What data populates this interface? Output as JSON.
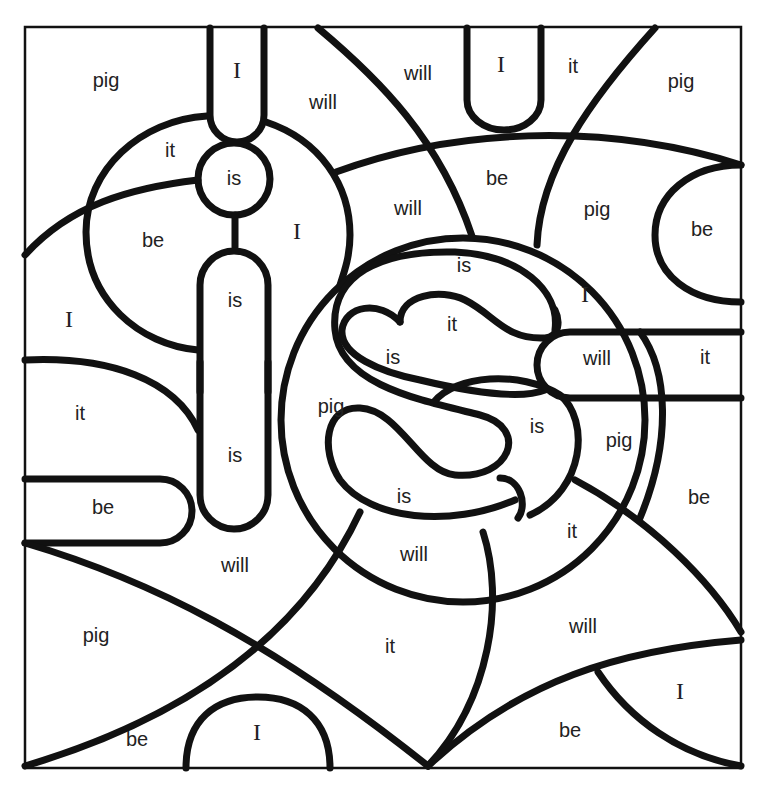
{
  "worksheet": {
    "type": "color-by-sight-word",
    "words": [
      "I",
      "is",
      "it",
      "be",
      "will",
      "pig"
    ],
    "colors": {
      "line": "#111111",
      "background": "#ffffff",
      "text": "#222222"
    }
  },
  "labels": [
    {
      "text": "pig",
      "x": 106,
      "y": 82
    },
    {
      "text": "I",
      "x": 237,
      "y": 72
    },
    {
      "text": "will",
      "x": 323,
      "y": 104
    },
    {
      "text": "will",
      "x": 418,
      "y": 75
    },
    {
      "text": "I",
      "x": 501,
      "y": 66
    },
    {
      "text": "it",
      "x": 573,
      "y": 68
    },
    {
      "text": "pig",
      "x": 681,
      "y": 83
    },
    {
      "text": "it",
      "x": 170,
      "y": 152
    },
    {
      "text": "is",
      "x": 234,
      "y": 180
    },
    {
      "text": "be",
      "x": 497,
      "y": 180
    },
    {
      "text": "will",
      "x": 408,
      "y": 210
    },
    {
      "text": "pig",
      "x": 597,
      "y": 211
    },
    {
      "text": "be",
      "x": 702,
      "y": 231
    },
    {
      "text": "be",
      "x": 153,
      "y": 242
    },
    {
      "text": "I",
      "x": 297,
      "y": 233
    },
    {
      "text": "is",
      "x": 464,
      "y": 267
    },
    {
      "text": "is",
      "x": 235,
      "y": 302
    },
    {
      "text": "I",
      "x": 585,
      "y": 296
    },
    {
      "text": "I",
      "x": 69,
      "y": 321
    },
    {
      "text": "it",
      "x": 452,
      "y": 326
    },
    {
      "text": "is",
      "x": 393,
      "y": 359
    },
    {
      "text": "will",
      "x": 597,
      "y": 360
    },
    {
      "text": "it",
      "x": 705,
      "y": 359
    },
    {
      "text": "pig",
      "x": 331,
      "y": 408
    },
    {
      "text": "it",
      "x": 80,
      "y": 415
    },
    {
      "text": "is",
      "x": 537,
      "y": 428
    },
    {
      "text": "pig",
      "x": 619,
      "y": 442
    },
    {
      "text": "is",
      "x": 235,
      "y": 457
    },
    {
      "text": "is",
      "x": 404,
      "y": 498
    },
    {
      "text": "be",
      "x": 699,
      "y": 499
    },
    {
      "text": "be",
      "x": 103,
      "y": 509
    },
    {
      "text": "it",
      "x": 572,
      "y": 533
    },
    {
      "text": "will",
      "x": 414,
      "y": 556
    },
    {
      "text": "will",
      "x": 235,
      "y": 567
    },
    {
      "text": "will",
      "x": 583,
      "y": 628
    },
    {
      "text": "pig",
      "x": 96,
      "y": 637
    },
    {
      "text": "it",
      "x": 390,
      "y": 648
    },
    {
      "text": "I",
      "x": 680,
      "y": 693
    },
    {
      "text": "I",
      "x": 257,
      "y": 734
    },
    {
      "text": "be",
      "x": 570,
      "y": 732
    },
    {
      "text": "be",
      "x": 137,
      "y": 741
    }
  ]
}
